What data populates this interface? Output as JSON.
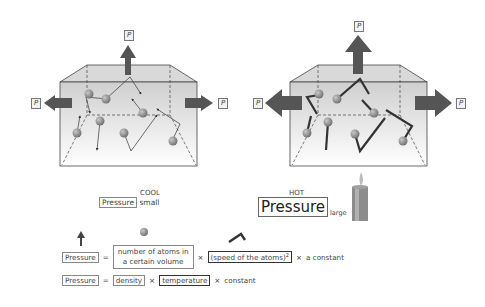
{
  "diagram": {
    "cool_panel": {
      "force_label": "P",
      "caption_title": "COOL",
      "pressure_word": "Pressure",
      "pressure_size": "small"
    },
    "hot_panel": {
      "force_label": "P",
      "caption_title": "HOT",
      "pressure_word": "Pressure",
      "pressure_size": "large",
      "heat_source": "candle"
    },
    "equation1": {
      "lhs": "Pressure",
      "equals": "=",
      "term1_line1": "number of atoms in",
      "term1_line2": "a certain volume",
      "times1": "×",
      "term2": "(speed of the atoms)",
      "term2_exp": "2",
      "times2": "×",
      "constant": "a constant"
    },
    "equation2": {
      "lhs": "Pressure",
      "equals": "=",
      "term1": "density",
      "times1": "×",
      "term2": "temperature",
      "times2": "×",
      "constant": "constant"
    },
    "colors": {
      "arrow": "#555555",
      "atom": "#8a8a8a",
      "box_fill": "#e2e2e2",
      "box_stroke": "#444444"
    }
  }
}
